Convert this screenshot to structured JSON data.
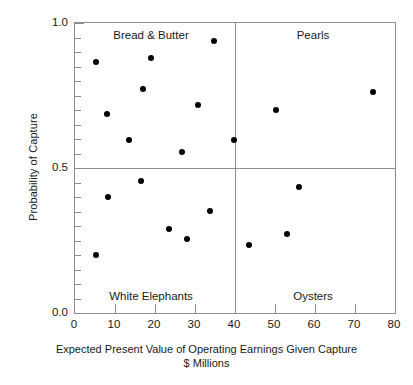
{
  "chart_data": {
    "type": "scatter",
    "title": "",
    "xlabel": "Expected Present Value of Operating Earnings Given Capture",
    "xlabel_line2": "$ Millions",
    "ylabel": "Probability of Capture",
    "xlim": [
      0,
      80
    ],
    "ylim": [
      0.0,
      1.0
    ],
    "xticks": [
      0,
      10,
      20,
      30,
      40,
      50,
      60,
      70,
      80
    ],
    "xtick_labels": [
      "0",
      "10",
      "20",
      "30",
      "40",
      "50",
      "60",
      "70",
      "80"
    ],
    "yticks": [
      0.0,
      0.5,
      1.0
    ],
    "ytick_labels": [
      "0.0",
      "0.5",
      "1.0"
    ],
    "y_minor_ticks": [
      0.05,
      0.1,
      0.15,
      0.2,
      0.25,
      0.3,
      0.35,
      0.4,
      0.45,
      0.55,
      0.6,
      0.65,
      0.7,
      0.75,
      0.8,
      0.85,
      0.9,
      0.95
    ],
    "grid": false,
    "legend": "none",
    "marker": "filled-circle",
    "marker_color": "#000000",
    "quadrant_divider_x": 40,
    "quadrant_divider_y": 0.5,
    "points": [
      {
        "x": 5.3,
        "y": 0.865,
        "quadrant": "Bread & Butter"
      },
      {
        "x": 8.0,
        "y": 0.685,
        "quadrant": "Bread & Butter"
      },
      {
        "x": 13.6,
        "y": 0.597,
        "quadrant": "Bread & Butter"
      },
      {
        "x": 16.5,
        "y": 0.455,
        "quadrant": "White Elephants"
      },
      {
        "x": 19.1,
        "y": 0.88,
        "quadrant": "Bread & Butter"
      },
      {
        "x": 16.9,
        "y": 0.772,
        "quadrant": "Bread & Butter"
      },
      {
        "x": 26.7,
        "y": 0.555,
        "quadrant": "Bread & Butter"
      },
      {
        "x": 30.8,
        "y": 0.717,
        "quadrant": "Bread & Butter"
      },
      {
        "x": 34.8,
        "y": 0.938,
        "quadrant": "Bread & Butter"
      },
      {
        "x": 39.8,
        "y": 0.597,
        "quadrant": "Bread & Butter"
      },
      {
        "x": 8.2,
        "y": 0.4,
        "quadrant": "White Elephants"
      },
      {
        "x": 5.2,
        "y": 0.2,
        "quadrant": "White Elephants"
      },
      {
        "x": 23.6,
        "y": 0.29,
        "quadrant": "White Elephants"
      },
      {
        "x": 27.9,
        "y": 0.255,
        "quadrant": "White Elephants"
      },
      {
        "x": 33.7,
        "y": 0.352,
        "quadrant": "White Elephants"
      },
      {
        "x": 50.3,
        "y": 0.7,
        "quadrant": "Pearls"
      },
      {
        "x": 74.6,
        "y": 0.763,
        "quadrant": "Pearls"
      },
      {
        "x": 43.4,
        "y": 0.235,
        "quadrant": "Oysters"
      },
      {
        "x": 53.0,
        "y": 0.272,
        "quadrant": "Oysters"
      },
      {
        "x": 56.0,
        "y": 0.434,
        "quadrant": "Oysters"
      }
    ],
    "annotations": [
      {
        "text": "Bread & Butter",
        "x": 19,
        "y": 0.955
      },
      {
        "text": "Pearls",
        "x": 59.5,
        "y": 0.955
      },
      {
        "text": "White Elephants",
        "x": 19,
        "y": 0.055
      },
      {
        "text": "Oysters",
        "x": 59.5,
        "y": 0.055
      }
    ]
  }
}
